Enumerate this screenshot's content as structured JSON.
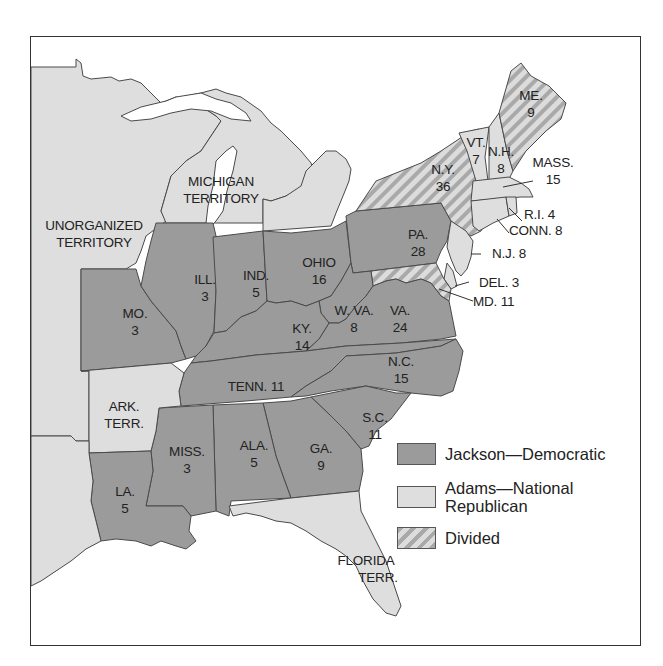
{
  "map": {
    "title": "Election of 1828",
    "colors": {
      "jackson": "#9b9b9b",
      "adams": "#dedede",
      "divided_light": "#dcdcdc",
      "divided_dark": "#a9a9a9",
      "border": "#444444",
      "water": "#ffffff"
    },
    "territories": [
      {
        "id": "unorganized",
        "label_lines": [
          "UNORGANIZED",
          "TERRITORY"
        ],
        "party": "none"
      },
      {
        "id": "michigan",
        "label_lines": [
          "MICHIGAN",
          "TERRITORY"
        ],
        "party": "none"
      },
      {
        "id": "arkansas",
        "label_lines": [
          "ARK.",
          "TERR."
        ],
        "party": "none"
      },
      {
        "id": "florida",
        "label_lines": [
          "FLORIDA",
          "TERR."
        ],
        "party": "none"
      }
    ],
    "states": [
      {
        "abbr": "ME.",
        "votes": "9",
        "party": "divided"
      },
      {
        "abbr": "VT.",
        "votes": "7",
        "party": "adams"
      },
      {
        "abbr": "N.H.",
        "votes": "8",
        "party": "adams"
      },
      {
        "abbr": "MASS.",
        "votes": "15",
        "party": "adams"
      },
      {
        "abbr": "R.I.",
        "votes": "4",
        "party": "adams"
      },
      {
        "abbr": "CONN.",
        "votes": "8",
        "party": "adams"
      },
      {
        "abbr": "N.Y.",
        "votes": "36",
        "party": "divided"
      },
      {
        "abbr": "N.J.",
        "votes": "8",
        "party": "adams"
      },
      {
        "abbr": "DEL.",
        "votes": "3",
        "party": "adams"
      },
      {
        "abbr": "MD.",
        "votes": "11",
        "party": "divided"
      },
      {
        "abbr": "PA.",
        "votes": "28",
        "party": "jackson"
      },
      {
        "abbr": "OHIO",
        "votes": "16",
        "party": "jackson"
      },
      {
        "abbr": "IND.",
        "votes": "5",
        "party": "jackson"
      },
      {
        "abbr": "ILL.",
        "votes": "3",
        "party": "jackson"
      },
      {
        "abbr": "MO.",
        "votes": "3",
        "party": "jackson"
      },
      {
        "abbr": "KY.",
        "votes": "14",
        "party": "jackson"
      },
      {
        "abbr": "W. VA.",
        "votes": "8",
        "party": "jackson"
      },
      {
        "abbr": "VA.",
        "votes": "24",
        "party": "jackson"
      },
      {
        "abbr": "TENN.",
        "votes": "11",
        "party": "jackson"
      },
      {
        "abbr": "N.C.",
        "votes": "15",
        "party": "jackson"
      },
      {
        "abbr": "S.C.",
        "votes": "11",
        "party": "jackson"
      },
      {
        "abbr": "GA.",
        "votes": "9",
        "party": "jackson"
      },
      {
        "abbr": "ALA.",
        "votes": "5",
        "party": "jackson"
      },
      {
        "abbr": "MISS.",
        "votes": "3",
        "party": "jackson"
      },
      {
        "abbr": "LA.",
        "votes": "5",
        "party": "jackson"
      }
    ],
    "labels": {
      "me": [
        "ME.",
        "9"
      ],
      "vt": [
        "VT.",
        "7"
      ],
      "nh": [
        "N.H.",
        "8"
      ],
      "mass": [
        "MASS.",
        "15"
      ],
      "ri": "R.I. 4",
      "conn": "CONN. 8",
      "ny": [
        "N.Y.",
        "36"
      ],
      "nj": "N.J. 8",
      "del": "DEL. 3",
      "md": "MD. 11",
      "pa": [
        "PA.",
        "28"
      ],
      "ohio": [
        "OHIO",
        "16"
      ],
      "ind": [
        "IND.",
        "5"
      ],
      "ill": [
        "ILL.",
        "3"
      ],
      "mo": [
        "MO.",
        "3"
      ],
      "ky": [
        "KY.",
        "14"
      ],
      "wva": [
        "W. VA.",
        "8"
      ],
      "va": [
        "VA.",
        "24"
      ],
      "tenn": "TENN. 11",
      "nc": [
        "N.C.",
        "15"
      ],
      "sc": [
        "S.C.",
        "11"
      ],
      "ga": [
        "GA.",
        "9"
      ],
      "ala": [
        "ALA.",
        "5"
      ],
      "miss": [
        "MISS.",
        "3"
      ],
      "la": [
        "LA.",
        "5"
      ],
      "unorganized": [
        "UNORGANIZED",
        "TERRITORY"
      ],
      "michigan": [
        "MICHIGAN",
        "TERRITORY"
      ],
      "ark": [
        "ARK.",
        "TERR."
      ],
      "florida": [
        "FLORIDA",
        "TERR."
      ]
    }
  },
  "legend": {
    "items": [
      {
        "label": "Jackson—Democratic",
        "pattern": "jackson"
      },
      {
        "label_line1": "Adams—National",
        "label_line2": "Republican",
        "pattern": "adams"
      },
      {
        "label": "Divided",
        "pattern": "divided"
      }
    ]
  }
}
